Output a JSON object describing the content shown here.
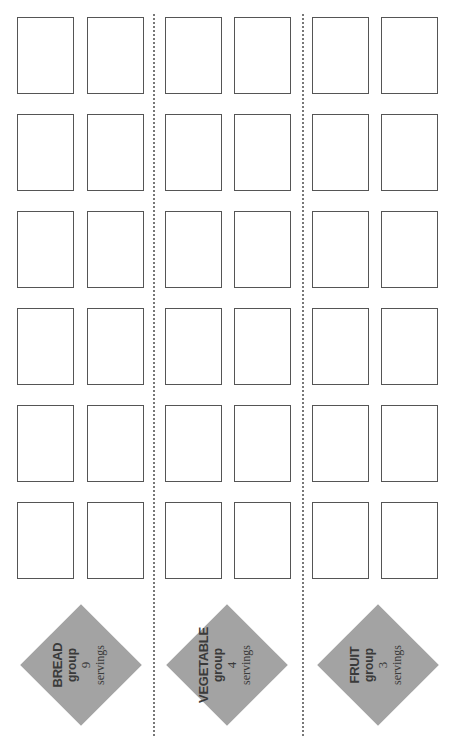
{
  "worksheet": {
    "groups": [
      {
        "name": "BREAD",
        "group_word": "group",
        "servings": "9",
        "servings_word": "servings"
      },
      {
        "name": "VEGETABLE",
        "group_word": "group",
        "servings": "4",
        "servings_word": "servings"
      },
      {
        "name": "FRUIT",
        "group_word": "group",
        "servings": "3",
        "servings_word": "servings"
      }
    ],
    "boxes_per_group": 12,
    "rows": 6,
    "boxes_per_row": 2,
    "colors": {
      "diamond": "#a3a3a3",
      "box_border": "#555555",
      "divider": "#777777",
      "text": "#3a3a3a"
    }
  }
}
